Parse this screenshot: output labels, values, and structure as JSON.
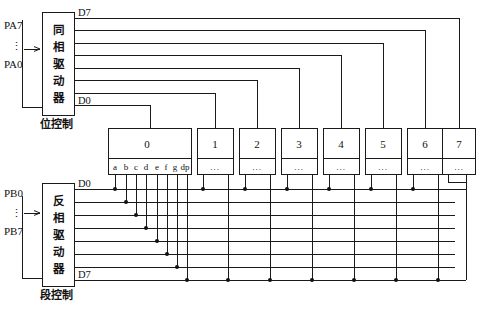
{
  "diagram": {
    "blocks": [
      {
        "id": "bit-driver",
        "label": "同相驱动器",
        "caption": "位控制",
        "input_top": "PA7",
        "input_bottom": "PA0",
        "input_ellipsis": "⋮",
        "out_top": "D7",
        "out_bottom": "D0"
      },
      {
        "id": "seg-driver",
        "label": "反相驱动器",
        "caption": "段控制",
        "input_top": "PB0",
        "input_bottom": "PB7",
        "input_ellipsis": "⋮",
        "out_top": "D0",
        "out_bottom": "D7"
      }
    ],
    "digits": [
      {
        "label": "0",
        "segments": [
          "a",
          "b",
          "c",
          "d",
          "e",
          "f",
          "g",
          "dp"
        ]
      },
      {
        "label": "1",
        "segments_ellipsis": "..."
      },
      {
        "label": "2",
        "segments_ellipsis": "..."
      },
      {
        "label": "3",
        "segments_ellipsis": "..."
      },
      {
        "label": "4",
        "segments_ellipsis": "..."
      },
      {
        "label": "5",
        "segments_ellipsis": "..."
      },
      {
        "label": "6",
        "segments_ellipsis": "..."
      },
      {
        "label": "7",
        "segments_ellipsis": "..."
      }
    ],
    "colors": {
      "stroke": "#1a1a1a",
      "fill": "#ffffff",
      "dot": "#111111"
    }
  }
}
